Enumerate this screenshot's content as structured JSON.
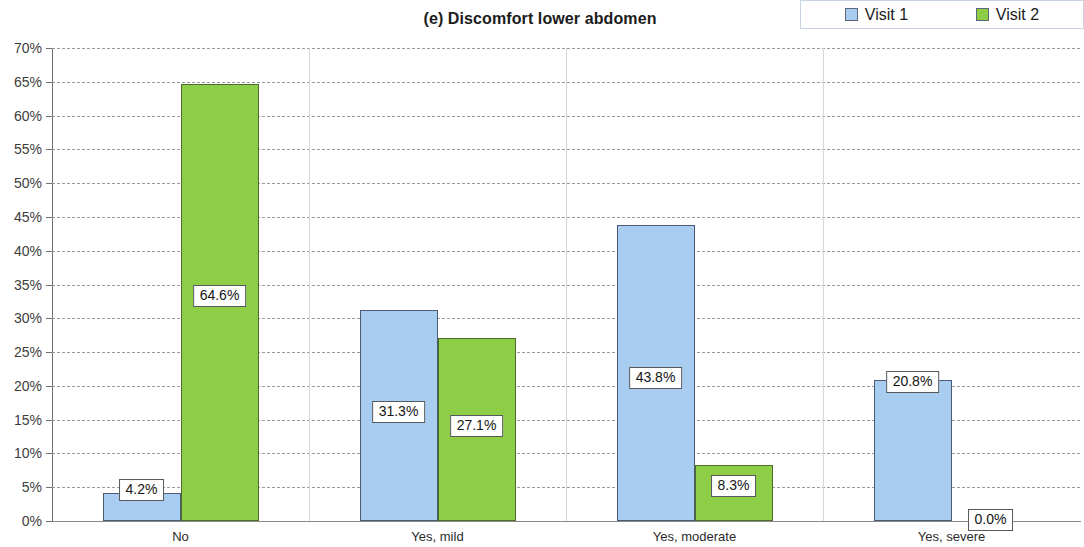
{
  "chart_data": {
    "type": "bar",
    "title": "(e) Discomfort lower abdomen",
    "xlabel": "",
    "ylabel": "",
    "categories": [
      "No",
      "Yes, mild",
      "Yes, moderate",
      "Yes, severe"
    ],
    "series": [
      {
        "name": "Visit 1",
        "color": "#a8cdf0",
        "values": [
          4.2,
          31.3,
          43.8,
          20.8
        ]
      },
      {
        "name": "Visit 2",
        "color": "#8ecd46",
        "values": [
          64.6,
          27.1,
          8.3,
          0.0
        ]
      }
    ],
    "value_labels": [
      [
        "4.2%",
        "31.3%",
        "43.8%",
        "20.8%"
      ],
      [
        "64.6%",
        "27.1%",
        "8.3%",
        "0.0%"
      ]
    ],
    "ylim": [
      0,
      70
    ],
    "ytick_values": [
      70,
      65,
      60,
      55,
      50,
      45,
      40,
      35,
      30,
      25,
      20,
      15,
      10,
      5,
      0
    ],
    "ytick_labels": [
      "70%",
      "65%",
      "60%",
      "55%",
      "50%",
      "45%",
      "40%",
      "35%",
      "30%",
      "25%",
      "20%",
      "15%",
      "10%",
      "5%",
      "0%"
    ],
    "grid": true,
    "legend_position": "top-right"
  },
  "legend": {
    "entries": [
      {
        "label": "Visit 1",
        "swatch": "legend-swatch-blue"
      },
      {
        "label": "Visit 2",
        "swatch": "legend-swatch-green"
      }
    ]
  }
}
